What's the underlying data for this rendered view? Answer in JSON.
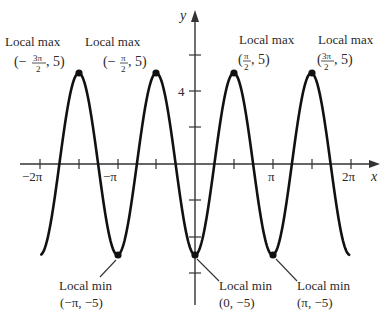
{
  "chart_data": {
    "type": "line",
    "title": "",
    "function": "y = -5cos(2x)",
    "xlabel": "x",
    "ylabel": "y",
    "xlim": [
      -6.283,
      6.283
    ],
    "ylim": [
      -7.5,
      8.5
    ],
    "grid": false,
    "x_ticks": [
      "-2π",
      "-3π/2",
      "-π",
      "-π/2",
      "0",
      "π/2",
      "π",
      "3π/2",
      "2π"
    ],
    "x_tick_labels": [
      {
        "at": -6.2832,
        "label": "−2π"
      },
      {
        "at": -3.1416,
        "label": "−π"
      },
      {
        "at": 3.1416,
        "label": "π"
      },
      {
        "at": 6.2832,
        "label": "2π"
      }
    ],
    "y_ticks": [
      6,
      4,
      2,
      -2,
      -4,
      -6
    ],
    "y_tick_labels": [
      {
        "at": 4,
        "label": "4"
      }
    ],
    "series": [
      {
        "name": "y = -5cos(2x)",
        "x": [
          -6.2832,
          -5.4978,
          -4.7124,
          -3.927,
          -3.1416,
          -2.3562,
          -1.5708,
          -0.7854,
          0,
          0.7854,
          1.5708,
          2.3562,
          3.1416,
          3.927,
          4.7124,
          5.4978,
          6.2832
        ],
        "y": [
          -5,
          0,
          5,
          0,
          -5,
          0,
          5,
          0,
          -5,
          0,
          5,
          0,
          -5,
          0,
          5,
          0,
          -5
        ]
      }
    ],
    "annotations": [
      {
        "type": "local max",
        "x": "-3π/2",
        "y": 5,
        "label": "Local max",
        "coord": "(−3π/2, 5)"
      },
      {
        "type": "local max",
        "x": "-π/2",
        "y": 5,
        "label": "Local max",
        "coord": "(−π/2, 5)"
      },
      {
        "type": "local max",
        "x": "π/2",
        "y": 5,
        "label": "Local max",
        "coord": "(π/2, 5)"
      },
      {
        "type": "local max",
        "x": "3π/2",
        "y": 5,
        "label": "Local max",
        "coord": "(3π/2, 5)"
      },
      {
        "type": "local min",
        "x": "-π",
        "y": -5,
        "label": "Local min",
        "coord": "(−π, −5)"
      },
      {
        "type": "local min",
        "x": "0",
        "y": -5,
        "label": "Local min",
        "coord": "(0, −5)"
      },
      {
        "type": "local min",
        "x": "π",
        "y": -5,
        "label": "Local min",
        "coord": "(π, −5)"
      }
    ]
  },
  "axes": {
    "x_label": "x",
    "y_label": "y",
    "tick_neg2pi": "−2π",
    "tick_negpi": "−π",
    "tick_pi": "π",
    "tick_2pi": "2π",
    "tick_4": "4"
  },
  "labels": {
    "max1": {
      "title": "Local max",
      "open": "(−",
      "num": "3π",
      "den": "2",
      "close": ", 5)"
    },
    "max2": {
      "title": "Local max",
      "open": "(−",
      "num": "π",
      "den": "2",
      "close": ", 5)"
    },
    "max3": {
      "title": "Local max",
      "open": "(",
      "num": "π",
      "den": "2",
      "close": ", 5)"
    },
    "max4": {
      "title": "Local max",
      "open": "(",
      "num": "3π",
      "den": "2",
      "close": ", 5)"
    },
    "min1": {
      "title": "Local min",
      "coord": "(−π, −5)"
    },
    "min2": {
      "title": "Local min",
      "coord": "(0, −5)"
    },
    "min3": {
      "title": "Local min",
      "coord": "(π, −5)"
    }
  },
  "colors": {
    "curve": "#111111",
    "axis": "#333333",
    "text": "#2a2a2a"
  }
}
